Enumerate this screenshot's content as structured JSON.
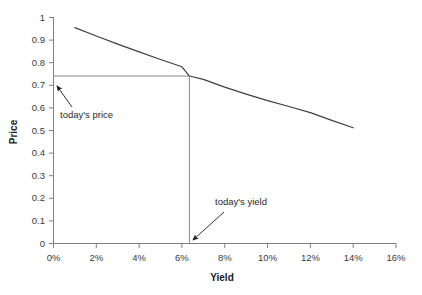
{
  "chart_data": {
    "type": "line",
    "title": "",
    "xlabel": "Yield",
    "ylabel": "Price",
    "xlim": [
      0,
      16
    ],
    "ylim": [
      0,
      1
    ],
    "grid": false,
    "legend": null,
    "x_tick_labels": [
      "0%",
      "2%",
      "4%",
      "6%",
      "8%",
      "10%",
      "12%",
      "14%",
      "16%"
    ],
    "x_tick_values": [
      0,
      2,
      4,
      6,
      8,
      10,
      12,
      14,
      16
    ],
    "y_tick_labels": [
      "0",
      "0.1",
      "0.2",
      "0.3",
      "0.4",
      "0.5",
      "0.6",
      "0.7",
      "0.8",
      "0.9",
      "1"
    ],
    "y_tick_values": [
      0,
      0.1,
      0.2,
      0.3,
      0.4,
      0.5,
      0.6,
      0.7,
      0.8,
      0.9,
      1
    ],
    "series": [
      {
        "name": "price-yield curve",
        "color": "#404040",
        "x": [
          1.0,
          2.0,
          3.0,
          4.0,
          5.0,
          6.0,
          6.35,
          7.0,
          8.0,
          9.0,
          10.0,
          11.0,
          12.0,
          13.0,
          14.0
        ],
        "y": [
          0.955,
          0.918,
          0.882,
          0.848,
          0.814,
          0.782,
          0.741,
          0.726,
          0.692,
          0.661,
          0.632,
          0.606,
          0.579,
          0.545,
          0.512
        ]
      }
    ],
    "markers": {
      "todays_yield": 6.35,
      "todays_price": 0.741
    },
    "annotations": [
      {
        "name": "todays-price",
        "text": "today's price",
        "text_x": 60,
        "text_y": 115,
        "arrow_from_x": 72,
        "arrow_from_y": 107,
        "arrow_to_x": 55,
        "arrow_to_y": 84
      },
      {
        "name": "todays-yield",
        "text": "today's yield",
        "text_x": 215,
        "text_y": 204,
        "arrow_from_x": 224,
        "arrow_from_y": 212,
        "arrow_to_x": 191,
        "arrow_to_y": 241
      }
    ],
    "axis_color": "#808080",
    "curve_color": "#404040",
    "marker_line_color": "#8a8a8a"
  }
}
